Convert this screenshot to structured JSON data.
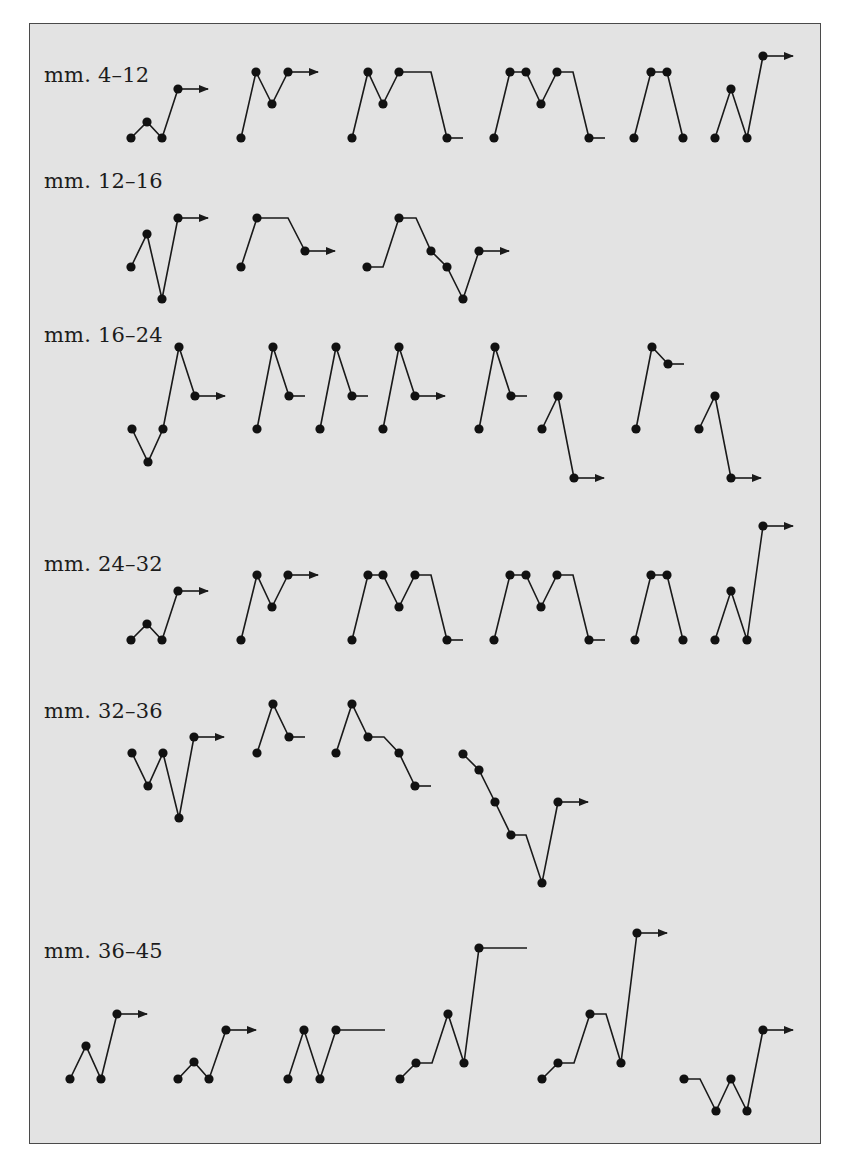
{
  "figure": {
    "background": "#e3e3e3",
    "stroke": "#1a1a1a",
    "dot_radius": 4.6,
    "rows": [
      {
        "label": "mm. 4–12",
        "label_pos": [
          44,
          79
        ],
        "glyphs": [
          {
            "points": [
              [
                131,
                138
              ],
              [
                147,
                122
              ],
              [
                162,
                138
              ],
              [
                178,
                89
              ]
            ],
            "end": {
              "type": "arrow",
              "x": 208
            }
          },
          {
            "points": [
              [
                241,
                138
              ],
              [
                256,
                72
              ],
              [
                272,
                104
              ],
              [
                288,
                72
              ]
            ],
            "end": {
              "type": "arrow",
              "x": 318
            }
          },
          {
            "points": [
              [
                352,
                138
              ],
              [
                368,
                72
              ],
              [
                383,
                104
              ],
              [
                399,
                72
              ],
              {
                "hold": 431
              },
              [
                447,
                138
              ]
            ],
            "end": {
              "type": "tick",
              "x": 463
            }
          },
          {
            "points": [
              [
                494,
                138
              ],
              [
                510,
                72
              ],
              [
                526,
                72
              ],
              [
                541,
                104
              ],
              [
                557,
                72
              ],
              {
                "hold": 573
              },
              [
                589,
                138
              ]
            ],
            "end": {
              "type": "tick",
              "x": 605
            }
          },
          {
            "points": [
              [
                634,
                138
              ],
              [
                651,
                72
              ],
              [
                667,
                72
              ],
              [
                683,
                138
              ]
            ],
            "end": null
          },
          {
            "points": [
              [
                715,
                138
              ],
              [
                731,
                89
              ],
              [
                747,
                138
              ],
              [
                763,
                56
              ]
            ],
            "end": {
              "type": "arrow",
              "x": 793
            }
          }
        ]
      },
      {
        "label": "mm. 12–16",
        "label_pos": [
          44,
          185
        ],
        "glyphs": [
          {
            "points": [
              [
                131,
                267
              ],
              [
                147,
                234
              ],
              [
                162,
                299
              ],
              [
                178,
                218
              ]
            ],
            "end": {
              "type": "arrow",
              "x": 208
            }
          },
          {
            "points": [
              [
                241,
                267
              ],
              [
                257,
                218
              ],
              {
                "hold": 288
              },
              [
                305,
                251
              ]
            ],
            "end": {
              "type": "arrow",
              "x": 335
            }
          },
          {
            "points": [
              [
                367,
                267
              ],
              {
                "hold": 383
              },
              [
                399,
                218
              ],
              {
                "hold": 416
              },
              [
                431,
                251
              ],
              [
                447,
                267
              ],
              [
                463,
                299
              ],
              [
                479,
                251
              ]
            ],
            "end": {
              "type": "arrow",
              "x": 509
            }
          }
        ]
      },
      {
        "label": "mm. 16–24",
        "label_pos": [
          44,
          339
        ],
        "glyphs": [
          {
            "points": [
              [
                132,
                429
              ],
              [
                148,
                462
              ],
              [
                163,
                429
              ],
              [
                179,
                347
              ],
              [
                195,
                396
              ]
            ],
            "end": {
              "type": "arrow",
              "x": 225
            }
          },
          {
            "points": [
              [
                257,
                429
              ],
              [
                273,
                347
              ],
              [
                289,
                396
              ]
            ],
            "end": {
              "type": "tick",
              "x": 305
            }
          },
          {
            "points": [
              [
                320,
                429
              ],
              [
                336,
                347
              ],
              [
                352,
                396
              ]
            ],
            "end": {
              "type": "tick",
              "x": 368
            }
          },
          {
            "points": [
              [
                383,
                429
              ],
              [
                399,
                347
              ],
              [
                415,
                396
              ]
            ],
            "end": {
              "type": "arrow",
              "x": 445
            }
          },
          {
            "points": [
              [
                479,
                429
              ],
              [
                495,
                347
              ],
              [
                511,
                396
              ]
            ],
            "end": {
              "type": "tick",
              "x": 527
            }
          },
          {
            "points": [
              [
                542,
                429
              ],
              [
                558,
                396
              ],
              [
                574,
                478
              ]
            ],
            "end": {
              "type": "arrow",
              "x": 604
            }
          },
          {
            "points": [
              [
                636,
                429
              ],
              [
                652,
                347
              ],
              [
                668,
                364
              ]
            ],
            "end": {
              "type": "tick",
              "x": 684
            }
          },
          {
            "points": [
              [
                699,
                429
              ],
              [
                715,
                396
              ],
              [
                731,
                478
              ]
            ],
            "end": {
              "type": "arrow",
              "x": 761
            }
          }
        ]
      },
      {
        "label": "mm. 24–32",
        "label_pos": [
          44,
          568
        ],
        "glyphs": [
          {
            "points": [
              [
                131,
                640
              ],
              [
                147,
                624
              ],
              [
                162,
                640
              ],
              [
                178,
                591
              ]
            ],
            "end": {
              "type": "arrow",
              "x": 208
            }
          },
          {
            "points": [
              [
                241,
                640
              ],
              [
                257,
                575
              ],
              [
                272,
                607
              ],
              [
                288,
                575
              ]
            ],
            "end": {
              "type": "arrow",
              "x": 318
            }
          },
          {
            "points": [
              [
                352,
                640
              ],
              [
                368,
                575
              ],
              [
                383,
                575
              ],
              [
                399,
                607
              ],
              [
                415,
                575
              ],
              {
                "hold": 431
              },
              [
                447,
                640
              ]
            ],
            "end": {
              "type": "tick",
              "x": 463
            }
          },
          {
            "points": [
              [
                494,
                640
              ],
              [
                510,
                575
              ],
              [
                526,
                575
              ],
              [
                541,
                607
              ],
              [
                557,
                575
              ],
              {
                "hold": 573
              },
              [
                589,
                640
              ]
            ],
            "end": {
              "type": "tick",
              "x": 605
            }
          },
          {
            "points": [
              [
                635,
                640
              ],
              [
                651,
                575
              ],
              [
                667,
                575
              ],
              [
                683,
                640
              ]
            ],
            "end": null
          },
          {
            "points": [
              [
                715,
                640
              ],
              [
                731,
                591
              ],
              [
                747,
                640
              ],
              [
                763,
                526
              ]
            ],
            "end": {
              "type": "arrow",
              "x": 793
            }
          }
        ]
      },
      {
        "label": "mm. 32–36",
        "label_pos": [
          44,
          715
        ],
        "glyphs": [
          {
            "points": [
              [
                132,
                753
              ],
              [
                148,
                786
              ],
              [
                163,
                753
              ],
              [
                179,
                818
              ],
              [
                194,
                737
              ]
            ],
            "end": {
              "type": "arrow",
              "x": 224
            }
          },
          {
            "points": [
              [
                257,
                753
              ],
              [
                273,
                704
              ],
              [
                289,
                737
              ]
            ],
            "end": {
              "type": "tick",
              "x": 305
            }
          },
          {
            "points": [
              [
                336,
                753
              ],
              [
                352,
                704
              ],
              [
                368,
                737
              ],
              {
                "hold": 384
              },
              [
                399,
                753
              ],
              [
                415,
                786
              ]
            ],
            "end": {
              "type": "tick",
              "x": 431
            }
          },
          {
            "points": [
              [
                463,
                754
              ],
              [
                479,
                770
              ],
              [
                495,
                802
              ],
              [
                511,
                835
              ],
              {
                "hold": 526
              },
              [
                542,
                883
              ],
              [
                558,
                802
              ]
            ],
            "end": {
              "type": "arrow",
              "x": 588
            }
          }
        ]
      },
      {
        "label": "mm. 36–45",
        "label_pos": [
          44,
          955
        ],
        "glyphs": [
          {
            "points": [
              [
                70,
                1079
              ],
              [
                86,
                1046
              ],
              [
                101,
                1079
              ],
              [
                117,
                1014
              ]
            ],
            "end": {
              "type": "arrow",
              "x": 147
            }
          },
          {
            "points": [
              [
                178,
                1079
              ],
              [
                194,
                1062
              ],
              [
                209,
                1079
              ],
              [
                226,
                1030
              ]
            ],
            "end": {
              "type": "arrow",
              "x": 256
            }
          },
          {
            "points": [
              [
                288,
                1079
              ],
              [
                304,
                1030
              ],
              [
                320,
                1079
              ],
              [
                336,
                1030
              ]
            ],
            "end": {
              "type": "tick",
              "x": 385
            }
          },
          {
            "points": [
              [
                400,
                1079
              ],
              [
                416,
                1063
              ],
              {
                "hold": 432
              },
              [
                448,
                1014
              ],
              [
                464,
                1063
              ],
              [
                479,
                948
              ]
            ],
            "end": {
              "type": "tick",
              "x": 527
            }
          },
          {
            "points": [
              [
                542,
                1079
              ],
              [
                558,
                1063
              ],
              {
                "hold": 574
              },
              [
                590,
                1014
              ],
              {
                "hold": 606
              },
              [
                621,
                1063
              ],
              [
                637,
                933
              ]
            ],
            "end": {
              "type": "arrow",
              "x": 667
            }
          },
          {
            "points": [
              [
                684,
                1079
              ],
              {
                "hold": 700
              },
              [
                716,
                1111
              ],
              [
                731,
                1079
              ],
              [
                747,
                1111
              ],
              [
                763,
                1030
              ]
            ],
            "end": {
              "type": "arrow",
              "x": 793
            }
          }
        ]
      }
    ]
  }
}
